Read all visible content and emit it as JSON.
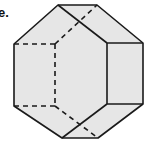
{
  "figure": {
    "label": "e.",
    "fill_color": "#e6e6e6",
    "line_color": "#1a1a1a",
    "outline": [
      [
        58,
        5
      ],
      [
        97,
        5
      ],
      [
        143,
        43
      ],
      [
        143,
        104
      ],
      [
        98,
        138
      ],
      [
        62,
        138
      ],
      [
        14,
        106
      ],
      [
        14,
        44
      ]
    ],
    "solid_edges": [
      [
        [
          58,
          5
        ],
        [
          107,
          43
        ]
      ],
      [
        [
          107,
          43
        ],
        [
          143,
          43
        ]
      ],
      [
        [
          107,
          43
        ],
        [
          107,
          104
        ]
      ],
      [
        [
          107,
          104
        ],
        [
          143,
          104
        ]
      ],
      [
        [
          107,
          104
        ],
        [
          62,
          138
        ]
      ]
    ],
    "hidden_edges": [
      [
        [
          14,
          44
        ],
        [
          55,
          44
        ]
      ],
      [
        [
          55,
          44
        ],
        [
          55,
          106
        ]
      ],
      [
        [
          14,
          106
        ],
        [
          55,
          106
        ]
      ],
      [
        [
          55,
          44
        ],
        [
          97,
          5
        ]
      ],
      [
        [
          55,
          106
        ],
        [
          98,
          138
        ]
      ]
    ]
  }
}
